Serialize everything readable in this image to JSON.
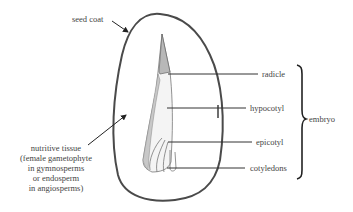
{
  "diagram": {
    "labels": {
      "seed_coat": "seed coat",
      "radicle": "radicle",
      "hypocotyl": "hypocotyl",
      "epicotyl": "epicotyl",
      "cotyledons": "cotyledons",
      "embryo": "embryo",
      "nutritive_tissue": [
        "nutritive tissue",
        "(female gametophyte",
        "in gymnosperms",
        "or endosperm",
        "in angiosperms)"
      ]
    },
    "colors": {
      "outline": "#4a4a4a",
      "embryo_fill": "#f2f2f2",
      "radicle_shade": "#b8b8b8",
      "text": "#444444",
      "leader_lines": "#333333"
    }
  }
}
